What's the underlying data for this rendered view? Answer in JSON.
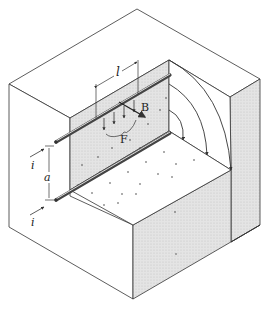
{
  "figure": {
    "colors": {
      "line": "#333333",
      "shade": "#d9d9d9",
      "rod": "#555555",
      "rod_highlight": "#eeeeee",
      "background": "#ffffff"
    }
  },
  "labels": {
    "length": "l",
    "field": "B",
    "force": "F",
    "current_top": "i",
    "current_bottom": "i",
    "separation": "a"
  }
}
